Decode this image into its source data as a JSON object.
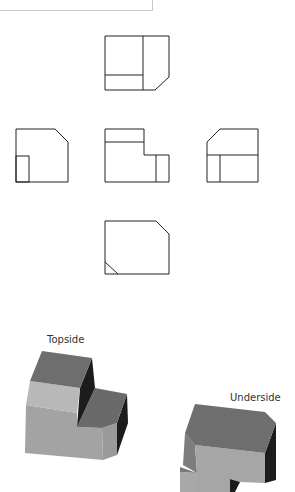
{
  "figure": {
    "orthographic_views": [
      "top",
      "left",
      "front",
      "right",
      "bottom"
    ],
    "iso_labels": {
      "topside": "Topside",
      "underside": "Underside"
    },
    "colors": {
      "line": "#222222",
      "face_top": "#6e6e6e",
      "face_band": "#b8b8b8",
      "face_front": "#a3a3a3",
      "face_dark": "#1c1c1c",
      "frame": "#c8c8c8"
    }
  }
}
